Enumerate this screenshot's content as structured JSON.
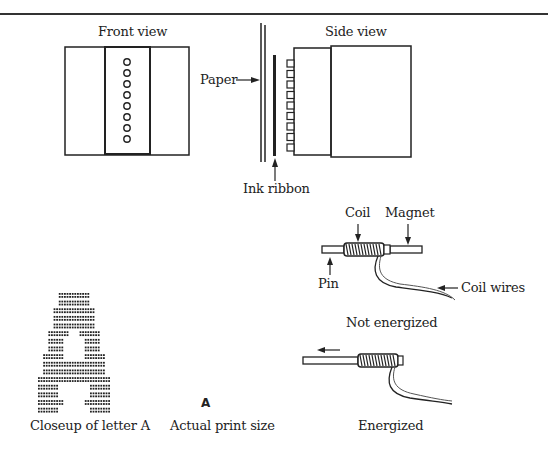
{
  "labels": {
    "front_view": "Front view",
    "side_view": "Side view",
    "paper": "Paper",
    "ink_ribbon": "Ink ribbon",
    "coil": "Coil",
    "magnet": "Magnet",
    "pin": "Pin",
    "coil_wires": "Coil wires",
    "not_energized": "Not energized",
    "energized": "Energized",
    "closeup_letter": "Closeup of letter A",
    "actual_print_size": "Actual print size",
    "print_sample": "A"
  },
  "front_view": {
    "pin_count": 8
  },
  "side_view": {
    "pin_count": 9
  },
  "dot_matrix_letter": {
    "letter": "A",
    "rows": [
      "....######....",
      "....######....",
      "...########...",
      "...########...",
      "...########...",
      "..####..####..",
      "..###....###..",
      "..###....###..",
      ".####....####.",
      ".############.",
      ".############.",
      "##############",
      "####......####",
      "####......####",
      "#####....#####",
      "####......####"
    ]
  },
  "colors": {
    "ink": "#222222",
    "background": "#ffffff"
  }
}
